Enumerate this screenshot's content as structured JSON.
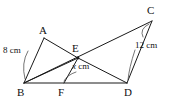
{
  "figure": {
    "background_color": "#ffffff",
    "line_color": "#1a1a1a",
    "vertices": [
      {
        "id": "A",
        "label": "A",
        "x": 44,
        "y": 38,
        "label_x": 39,
        "label_y": 25
      },
      {
        "id": "B",
        "label": "B",
        "x": 24,
        "y": 83,
        "label_x": 17,
        "label_y": 88
      },
      {
        "id": "C",
        "label": "C",
        "x": 152,
        "y": 21,
        "label_x": 147,
        "label_y": 6
      },
      {
        "id": "D",
        "label": "D",
        "x": 127,
        "y": 83,
        "label_x": 124,
        "label_y": 88
      },
      {
        "id": "E",
        "label": "E",
        "x": 78,
        "y": 58,
        "label_x": 72,
        "label_y": 44
      },
      {
        "id": "F",
        "label": "F",
        "x": 64,
        "y": 83,
        "label_x": 58,
        "label_y": 88
      }
    ],
    "edges": [
      {
        "name": "edge-A-B",
        "from": "A",
        "to": "B"
      },
      {
        "name": "edge-A-E",
        "from": "A",
        "to": "E"
      },
      {
        "name": "edge-B-E",
        "from": "B",
        "to": "E"
      },
      {
        "name": "edge-B-D",
        "from": "B",
        "to": "D"
      },
      {
        "name": "edge-B-C",
        "from": "B",
        "to": "C"
      },
      {
        "name": "edge-E-D",
        "from": "E",
        "to": "D"
      },
      {
        "name": "edge-E-F",
        "from": "E",
        "to": "F"
      },
      {
        "name": "edge-C-D",
        "from": "C",
        "to": "D"
      }
    ],
    "measurements": [
      {
        "id": "AB",
        "text": "8 cm",
        "value": 8,
        "unit": "cm",
        "labels_segment": "A-B",
        "label_x": 4,
        "label_y": 47,
        "leader": "M28 51 Q 22 62 26 79"
      },
      {
        "id": "EF",
        "text": "x cm",
        "italic_part": "x",
        "rest": " cm",
        "value": "x",
        "unit": "cm",
        "labels_segment": "E-F",
        "label_x": 74,
        "label_y": 63,
        "leader": "M75 73 Q 66 75 64 81"
      },
      {
        "id": "CD",
        "text": "12 cm",
        "value": 12,
        "unit": "cm",
        "labels_segment": "C-D",
        "label_x": 136,
        "label_y": 42,
        "leader": "M143 36 Q 137 30 148 25"
      },
      {
        "id": "CD-arc",
        "leader": "M134 50 Q 128 68 128 80"
      }
    ]
  }
}
